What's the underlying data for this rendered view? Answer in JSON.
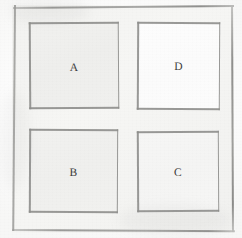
{
  "figure": {
    "medium": "pencil-on-paper",
    "outer_frame": {
      "name": "outer-square-border",
      "stroke_color": "#8e8e8c",
      "fill_color": "#f2f2f0"
    },
    "cells": [
      {
        "id": "A",
        "label": "A",
        "position": "top-left",
        "fill_color": "#efefed",
        "stroke_color": "#8a8a88"
      },
      {
        "id": "D",
        "label": "D",
        "position": "top-right",
        "fill_color": "#fcfcfc",
        "stroke_color": "#8a8a88"
      },
      {
        "id": "B",
        "label": "B",
        "position": "bottom-left",
        "fill_color": "#f0f0ee",
        "stroke_color": "#8a8a88"
      },
      {
        "id": "C",
        "label": "C",
        "position": "bottom-right",
        "fill_color": "#f5f5f4",
        "stroke_color": "#8a8a88"
      }
    ],
    "background_color": "#ffffff",
    "label_color": "#3b3b3a"
  }
}
